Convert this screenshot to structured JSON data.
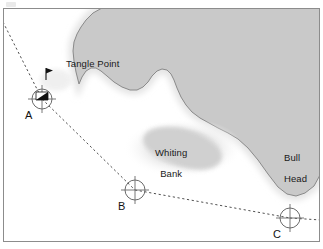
{
  "chart": {
    "type": "nautical-chart",
    "title": "",
    "frame": {
      "x": 3,
      "y": 8,
      "width": 317,
      "height": 234,
      "border_color": "#8c8c8c",
      "sea_color": "#ffffff"
    },
    "colors": {
      "land": "#c9c9c9",
      "land_outline": "#8a8a8a",
      "shoal": "#cfcfcf",
      "shoal_halo": "#eaeaea",
      "sea": "#ffffff",
      "line": "#555555",
      "text": "#1a1a1a",
      "beacon": "#000000",
      "border": "#8c8c8c"
    },
    "features": [
      {
        "name": "Tangle Point",
        "kind": "headland",
        "label": "Tangle Point",
        "label_x": 66,
        "label_y": 58
      },
      {
        "name": "Whiting Bank",
        "kind": "shoal",
        "label": "Whiting\nBank",
        "label_line1": "Whiting",
        "label_line2": "Bank",
        "label_x": 144,
        "label_y": 137
      },
      {
        "name": "Bull Head",
        "kind": "headland",
        "label": "Bull\nHead",
        "label_line1": "Bull",
        "label_line2": "Head",
        "label_x": 273,
        "label_y": 142
      }
    ],
    "stations": [
      {
        "id": "A",
        "label": "A",
        "x": 42,
        "y": 99,
        "radius": 10,
        "label_x": 25,
        "label_y": 110,
        "has_beacon": true
      },
      {
        "id": "B",
        "label": "B",
        "x": 135,
        "y": 190,
        "radius": 10,
        "label_x": 118,
        "label_y": 201,
        "has_beacon": false
      },
      {
        "id": "C",
        "label": "C",
        "x": 290,
        "y": 218,
        "radius": 10,
        "label_x": 273,
        "label_y": 229,
        "has_beacon": false
      }
    ],
    "bearing_lines": [
      {
        "name": "northwest-bearing-from-a",
        "from": [
          3,
          22
        ],
        "to": [
          42,
          99
        ],
        "style": "dashed"
      },
      {
        "name": "leg-a-to-b",
        "from": [
          42,
          99
        ],
        "to": [
          135,
          190
        ],
        "style": "dashed"
      },
      {
        "name": "leg-b-to-c",
        "from": [
          135,
          190
        ],
        "to": [
          290,
          218
        ],
        "style": "dashed"
      },
      {
        "name": "leg-c-east",
        "from": [
          290,
          218
        ],
        "to": [
          320,
          220
        ],
        "style": "dashed"
      }
    ],
    "land_outline_path": "M 102 8 L 320 8 L 320 175 L 314 186 L 305 193 L 296 196 L 287 194 L 278 187 L 268 174 L 258 160 L 248 148 L 238 139 L 228 133 L 218 128 L 209 123 L 200 118 L 192 112 L 186 105 L 181 97 L 177 88 L 174 80 L 171 74 L 167 70 L 162 69 L 157 71 L 152 76 L 148 82 L 143 87 L 137 90 L 130 90 L 122 87 L 114 82 L 107 76 L 101 71 L 96 68 L 91 68 L 86 71 L 82 77 L 79 84 L 76 72 L 74 61 L 73 51 L 74 42 L 77 34 L 81 27 L 86 20 L 93 13 L 102 8 Z",
    "shoal_path": "M 150 130 C 162 125 178 126 192 131 C 206 136 217 144 221 152 C 224 159 220 165 212 168 C 203 171 191 170 179 166 C 166 162 154 155 147 148 C 141 142 142 134 150 130 Z",
    "beacon": {
      "name": "beacon-at-a",
      "flag_x": 45,
      "flag_y": 70,
      "mark_x": 40,
      "mark_y": 94
    }
  }
}
